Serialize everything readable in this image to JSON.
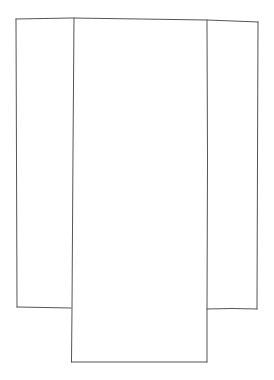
{
  "diagram": {
    "stroke_color": "#555555",
    "background": "#ffffff",
    "panels": [
      {
        "name": "left-panel",
        "x1": 16,
        "y1": 18,
        "x2": 72,
        "y2": 307
      },
      {
        "name": "center-panel",
        "x1": 72,
        "y1": 18,
        "x2": 207,
        "y2": 362
      },
      {
        "name": "right-panel",
        "x1": 207,
        "y1": 20,
        "x2": 258,
        "y2": 308
      }
    ]
  }
}
